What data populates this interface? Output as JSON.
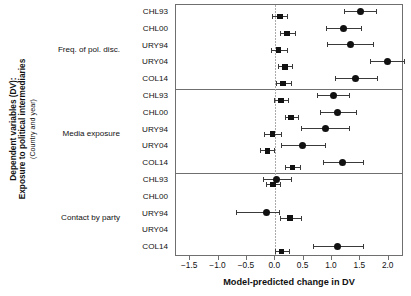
{
  "axis_title_y_main": "Dependent variables (DV):",
  "axis_title_y_main2": "Exposure to political intermediaries",
  "axis_title_y_sub": "(Country and year)",
  "axis_title_x": "Model-predicted change in DV",
  "axis_title_x_clipped": "",
  "chart_data": {
    "type": "scatter",
    "title": "",
    "xlabel": "Model-predicted change in DV",
    "ylabel": "Dependent variables (DV): Exposure to political intermediaries (Country and year)",
    "xlim": [
      -1.75,
      2.27
    ],
    "xticks": [
      -1.5,
      -1.0,
      -0.5,
      0.0,
      0.5,
      1.0,
      1.5,
      2.0
    ],
    "xticklabels": [
      "−1.5",
      "−1.0",
      "−0.5",
      "0.0",
      "0.5",
      "1.0",
      "1.5",
      "2.0"
    ],
    "grid": false,
    "legend": "none",
    "reference_line": 0.0,
    "panels": [
      {
        "label": "Freq. of pol. disc.",
        "rows": [
          {
            "category": "CHL93",
            "points": [
              {
                "series": "square",
                "estimate": 0.08,
                "ci_low": -0.05,
                "ci_high": 0.21
              },
              {
                "series": "circle",
                "estimate": 1.5,
                "ci_low": 1.21,
                "ci_high": 1.78
              }
            ]
          },
          {
            "category": "CHL00",
            "points": [
              {
                "series": "square",
                "estimate": 0.21,
                "ci_low": 0.08,
                "ci_high": 0.34
              },
              {
                "series": "circle",
                "estimate": 1.21,
                "ci_low": 0.9,
                "ci_high": 1.52
              }
            ]
          },
          {
            "category": "URY94",
            "points": [
              {
                "series": "square",
                "estimate": 0.06,
                "ci_low": -0.08,
                "ci_high": 0.21
              },
              {
                "series": "circle",
                "estimate": 1.32,
                "ci_low": 0.92,
                "ci_high": 1.73
              }
            ]
          },
          {
            "category": "URY04",
            "points": [
              {
                "series": "square",
                "estimate": 0.17,
                "ci_low": 0.05,
                "ci_high": 0.3
              },
              {
                "series": "circle",
                "estimate": 1.98,
                "ci_low": 1.67,
                "ci_high": 2.27
              }
            ]
          },
          {
            "category": "COL14",
            "points": [
              {
                "series": "square",
                "estimate": 0.14,
                "ci_low": 0.01,
                "ci_high": 0.27
              },
              {
                "series": "circle",
                "estimate": 1.41,
                "ci_low": 1.06,
                "ci_high": 1.79
              }
            ]
          }
        ]
      },
      {
        "label": "Media exposure",
        "rows": [
          {
            "category": "CHL93",
            "points": [
              {
                "series": "square",
                "estimate": 0.1,
                "ci_low": -0.03,
                "ci_high": 0.23
              },
              {
                "series": "circle",
                "estimate": 1.02,
                "ci_low": 0.74,
                "ci_high": 1.3
              }
            ]
          },
          {
            "category": "CHL00",
            "points": [
              {
                "series": "square",
                "estimate": 0.28,
                "ci_low": 0.18,
                "ci_high": 0.4
              },
              {
                "series": "circle",
                "estimate": 1.1,
                "ci_low": 0.79,
                "ci_high": 1.43
              }
            ]
          },
          {
            "category": "URY94",
            "points": [
              {
                "series": "square",
                "estimate": -0.05,
                "ci_low": -0.19,
                "ci_high": 0.11
              },
              {
                "series": "circle",
                "estimate": 0.88,
                "ci_low": 0.46,
                "ci_high": 1.3
              }
            ]
          },
          {
            "category": "URY04",
            "points": [
              {
                "series": "square",
                "estimate": -0.14,
                "ci_low": -0.27,
                "ci_high": -0.02
              },
              {
                "series": "circle",
                "estimate": 0.48,
                "ci_low": 0.1,
                "ci_high": 0.87
              }
            ]
          },
          {
            "category": "COL14",
            "points": [
              {
                "series": "square",
                "estimate": 0.3,
                "ci_low": 0.18,
                "ci_high": 0.43
              },
              {
                "series": "circle",
                "estimate": 1.19,
                "ci_low": 0.85,
                "ci_high": 1.54
              }
            ]
          }
        ]
      },
      {
        "label": "Contact by party",
        "rows": [
          {
            "category": "CHL93",
            "points": [
              {
                "series": "square",
                "estimate": -0.04,
                "ci_low": -0.17,
                "ci_high": 0.09
              },
              {
                "series": "circle",
                "estimate": 0.02,
                "ci_low": -0.21,
                "ci_high": 0.28
              }
            ]
          },
          {
            "category": "CHL00",
            "points": []
          },
          {
            "category": "URY94",
            "points": [
              {
                "series": "square",
                "estimate": 0.26,
                "ci_low": 0.09,
                "ci_high": 0.45
              },
              {
                "series": "circle",
                "estimate": -0.16,
                "ci_low": -0.7,
                "ci_high": 0.06
              }
            ]
          },
          {
            "category": "URY04",
            "points": []
          },
          {
            "category": "COL14",
            "points": [
              {
                "series": "square",
                "estimate": 0.11,
                "ci_low": -0.01,
                "ci_high": 0.24
              },
              {
                "series": "circle",
                "estimate": 1.1,
                "ci_low": 0.67,
                "ci_high": 1.55
              }
            ]
          }
        ]
      }
    ]
  }
}
